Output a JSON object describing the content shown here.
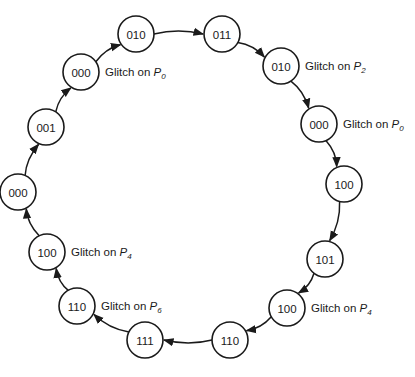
{
  "diagram": {
    "type": "state-sequence-cycle",
    "colors": {
      "stroke": "#1a1a1a",
      "background": "#ffffff"
    },
    "nodes": [
      {
        "id": "n0",
        "label": "010",
        "x": 136,
        "y": 34
      },
      {
        "id": "n1",
        "label": "011",
        "x": 222,
        "y": 34
      },
      {
        "id": "n2",
        "label": "010",
        "x": 281,
        "y": 66,
        "annotation": {
          "prefix": "Glitch on ",
          "var": "P",
          "sub": "2"
        }
      },
      {
        "id": "n3",
        "label": "000",
        "x": 319,
        "y": 124,
        "annotation": {
          "prefix": "Glitch on ",
          "var": "P",
          "sub": "0"
        }
      },
      {
        "id": "n4",
        "label": "100",
        "x": 344,
        "y": 184
      },
      {
        "id": "n5",
        "label": "101",
        "x": 325,
        "y": 259
      },
      {
        "id": "n6",
        "label": "100",
        "x": 287,
        "y": 308,
        "annotation": {
          "prefix": "Glitch on ",
          "var": "P",
          "sub": "4"
        }
      },
      {
        "id": "n7",
        "label": "110",
        "x": 230,
        "y": 340
      },
      {
        "id": "n8",
        "label": "111",
        "x": 145,
        "y": 340
      },
      {
        "id": "n9",
        "label": "110",
        "x": 77,
        "y": 306,
        "annotation": {
          "prefix": "Glitch on ",
          "var": "P",
          "sub": "6"
        }
      },
      {
        "id": "n10",
        "label": "100",
        "x": 47,
        "y": 252,
        "annotation": {
          "prefix": "Glitch on ",
          "var": "P",
          "sub": "4"
        }
      },
      {
        "id": "n11",
        "label": "000",
        "x": 18,
        "y": 192
      },
      {
        "id": "n12",
        "label": "001",
        "x": 46,
        "y": 127
      },
      {
        "id": "n13",
        "label": "000",
        "x": 81,
        "y": 72,
        "annotation": {
          "prefix": "Glitch on ",
          "var": "P",
          "sub": "0"
        }
      }
    ],
    "edges": [
      {
        "from": "n0",
        "to": "n1"
      },
      {
        "from": "n1",
        "to": "n2"
      },
      {
        "from": "n2",
        "to": "n3"
      },
      {
        "from": "n3",
        "to": "n4"
      },
      {
        "from": "n4",
        "to": "n5"
      },
      {
        "from": "n5",
        "to": "n6"
      },
      {
        "from": "n6",
        "to": "n7"
      },
      {
        "from": "n7",
        "to": "n8"
      },
      {
        "from": "n8",
        "to": "n9"
      },
      {
        "from": "n9",
        "to": "n10"
      },
      {
        "from": "n10",
        "to": "n11"
      },
      {
        "from": "n11",
        "to": "n12"
      },
      {
        "from": "n12",
        "to": "n13"
      },
      {
        "from": "n13",
        "to": "n0"
      }
    ]
  }
}
